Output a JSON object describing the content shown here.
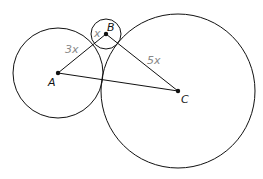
{
  "diagram": {
    "type": "tangent-circles-triangle",
    "points": [
      {
        "id": "A",
        "label": "A",
        "x": 58,
        "y": 73
      },
      {
        "id": "B",
        "label": "B",
        "x": 106,
        "y": 34
      },
      {
        "id": "C",
        "label": "C",
        "x": 178,
        "y": 91
      }
    ],
    "circles": [
      {
        "center": "A",
        "r": 45
      },
      {
        "center": "B",
        "r": 15
      },
      {
        "center": "C",
        "r": 77
      }
    ],
    "segments": [
      [
        "A",
        "B"
      ],
      [
        "B",
        "C"
      ],
      [
        "A",
        "C"
      ]
    ],
    "length_labels": {
      "AB": "3x",
      "BC": "5x",
      "B_radius": "x"
    },
    "colors": {
      "stroke": "#111111",
      "length_label": "#888888"
    }
  }
}
